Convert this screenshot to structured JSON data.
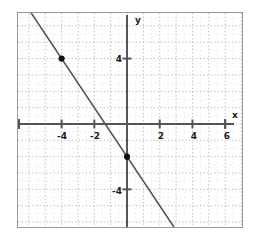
{
  "chart_data": {
    "type": "line",
    "title": "",
    "xlabel": "x",
    "ylabel": "y",
    "xlim": [
      -6.7,
      7.0
    ],
    "ylim": [
      -13.6,
      13.3
    ],
    "grid": true,
    "grid_major_step": 1,
    "grid_minor_step": 0.5,
    "legend": "none",
    "xticks": [
      -4,
      -2,
      2,
      4,
      6
    ],
    "xtick_labels": [
      "-4",
      "-2",
      "2",
      "4",
      "6"
    ],
    "yticks": [
      12,
      8,
      4,
      -4,
      -8
    ],
    "ytick_labels": [
      "12",
      "8",
      "4",
      "-4",
      "-8"
    ],
    "series": [
      {
        "name": "line",
        "kind": "line",
        "slope": -1.5,
        "intercept": -2,
        "x": [
          -6.7,
          7.0
        ],
        "y": [
          8.05,
          -12.5
        ],
        "color": "#555555"
      },
      {
        "name": "marked-points",
        "kind": "scatter",
        "color": "#111111",
        "points": [
          {
            "x": -4,
            "y": 4,
            "label": ""
          },
          {
            "x": 0,
            "y": -2,
            "label": ""
          },
          {
            "x": 6,
            "y": -11,
            "label": ""
          }
        ]
      }
    ]
  },
  "axis_labels": {
    "x_name": "x",
    "y_name": "y"
  },
  "colors": {
    "frame": "#9a9a9a",
    "axis": "#555555",
    "grid": "#b5b5b5",
    "line": "#555555",
    "point": "#111111",
    "background": "#ffffff"
  }
}
